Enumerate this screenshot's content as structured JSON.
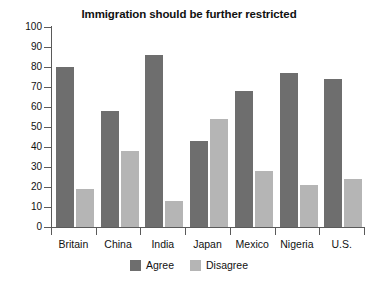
{
  "chart_data": {
    "type": "bar",
    "title": "Immigration should be further restricted",
    "xlabel": "",
    "ylabel": "",
    "ylim": [
      0,
      100
    ],
    "yticks": [
      0,
      10,
      20,
      30,
      40,
      50,
      60,
      70,
      80,
      90,
      100
    ],
    "grid": false,
    "legend_position": "bottom-center",
    "categories": [
      "Britain",
      "China",
      "India",
      "Japan",
      "Mexico",
      "Nigeria",
      "U.S."
    ],
    "series": [
      {
        "name": "Agree",
        "color": "#6e6e6e",
        "values": [
          80,
          58,
          86,
          43,
          68,
          77,
          74
        ]
      },
      {
        "name": "Disagree",
        "color": "#b5b5b5",
        "values": [
          19,
          38,
          13,
          54,
          28,
          21,
          24
        ]
      }
    ]
  },
  "legend": {
    "items": [
      {
        "label": "Agree",
        "color": "#6e6e6e"
      },
      {
        "label": "Disagree",
        "color": "#b5b5b5"
      }
    ]
  }
}
